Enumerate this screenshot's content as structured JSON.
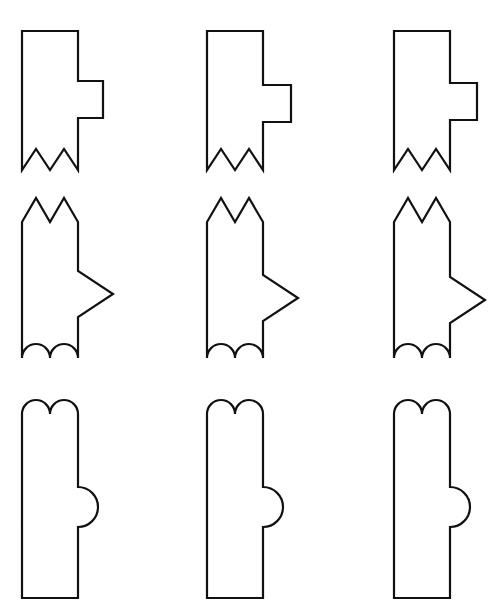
{
  "figure": {
    "description": "A three-by-three grid of outlined flag-like shapes. Each row shares a silhouette family; within a row the side protrusion shifts position.",
    "background_color": "#ffffff",
    "stroke_color": "#111111",
    "fill_color": "#ffffff",
    "stroke_width": 2.2,
    "canvas": {
      "width": 497,
      "height": 614
    },
    "rows": 3,
    "columns": 3
  },
  "shapes": [
    {
      "id": "shape-r1c1",
      "row": 1,
      "column": 1,
      "row_family": "zigzag-bottom-square-tab",
      "top_edge": "flat",
      "bottom_edge": "zigzag",
      "protrusion": "square-tab-right",
      "protrusion_vertical_position": "upper-middle",
      "path": "M 22 31 L 78 31 L 78 81 L 103 81 L 103 118 L 78 118 L 78 170 L 64 149 L 50 170 L 36 149 L 22 170 Z"
    },
    {
      "id": "shape-r1c2",
      "row": 1,
      "column": 2,
      "row_family": "zigzag-bottom-square-tab",
      "top_edge": "flat",
      "bottom_edge": "zigzag",
      "protrusion": "square-tab-right",
      "protrusion_vertical_position": "middle",
      "path": "M 207 31 L 263 31 L 263 85 L 291 85 L 291 122 L 263 122 L 263 170 L 249 149 L 235 170 L 221 149 L 207 170 Z"
    },
    {
      "id": "shape-r1c3",
      "row": 1,
      "column": 3,
      "row_family": "zigzag-bottom-square-tab",
      "top_edge": "flat",
      "bottom_edge": "zigzag",
      "protrusion": "square-tab-right",
      "protrusion_vertical_position": "middle-low",
      "path": "M 394 31 L 450 31 L 450 83 L 477 83 L 477 120 L 450 120 L 450 170 L 436 149 L 422 170 L 408 149 L 394 170 Z"
    },
    {
      "id": "shape-r2c1",
      "row": 2,
      "column": 1,
      "row_family": "twin-peak-top-arrow",
      "top_edge": "twin-peaks",
      "bottom_edge": "scalloped",
      "protrusion": "arrow-point-right",
      "protrusion_vertical_position": "middle",
      "path": "M 22 222 L 36 198 L 50 222 L 64 198 L 78 222 L 78 271 L 113 294 L 78 317 L 78 358 A 14 14 0 0 0 50 358 A 14 14 0 0 0 22 358 Z"
    },
    {
      "id": "shape-r2c2",
      "row": 2,
      "column": 2,
      "row_family": "twin-peak-top-arrow",
      "top_edge": "twin-peaks",
      "bottom_edge": "scalloped",
      "protrusion": "arrow-point-right",
      "protrusion_vertical_position": "middle-low",
      "path": "M 207 222 L 221 198 L 235 222 L 249 198 L 263 222 L 263 275 L 298 298 L 263 321 L 263 358 A 14 14 0 0 0 235 358 A 14 14 0 0 0 207 358 Z"
    },
    {
      "id": "shape-r2c3",
      "row": 2,
      "column": 3,
      "row_family": "twin-peak-top-arrow",
      "top_edge": "twin-peaks",
      "bottom_edge": "scalloped",
      "protrusion": "arrow-point-right",
      "protrusion_vertical_position": "low",
      "path": "M 394 222 L 408 198 L 422 222 L 436 198 L 450 222 L 450 277 L 485 300 L 450 323 L 450 358 A 14 14 0 0 0 422 358 A 14 14 0 0 0 394 358 Z"
    },
    {
      "id": "shape-r3c1",
      "row": 3,
      "column": 1,
      "row_family": "rounded-twin-dome-top-bump",
      "top_edge": "twin-domes",
      "bottom_edge": "flat",
      "protrusion": "semicircle-bump-right",
      "protrusion_vertical_position": "middle",
      "path": "M 22 598 L 22 414 A 14 14 0 0 1 50 414 A 14 14 0 0 1 78 414 L 78 487 A 20 20 0 0 1 78 527 L 78 598 Z"
    },
    {
      "id": "shape-r3c2",
      "row": 3,
      "column": 2,
      "row_family": "rounded-twin-dome-top-bump",
      "top_edge": "twin-domes",
      "bottom_edge": "flat",
      "protrusion": "semicircle-bump-right",
      "protrusion_vertical_position": "middle",
      "path": "M 207 598 L 207 414 A 14 14 0 0 1 235 414 A 14 14 0 0 1 263 414 L 263 487 A 20 20 0 0 1 263 527 L 263 598 Z"
    },
    {
      "id": "shape-r3c3",
      "row": 3,
      "column": 3,
      "row_family": "rounded-twin-dome-top-bump",
      "top_edge": "twin-domes",
      "bottom_edge": "flat",
      "protrusion": "semicircle-bump-right",
      "protrusion_vertical_position": "middle",
      "path": "M 394 598 L 394 414 A 14 14 0 0 1 422 414 A 14 14 0 0 1 450 414 L 450 487 A 20 20 0 0 1 450 527 L 450 598 Z"
    }
  ]
}
